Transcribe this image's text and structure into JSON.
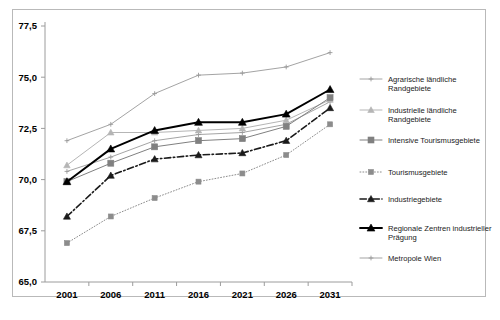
{
  "chart_data": {
    "type": "line",
    "title": "",
    "subtitle": "",
    "xlabel": "",
    "ylabel": "",
    "x": [
      2001,
      2006,
      2011,
      2016,
      2021,
      2026,
      2031
    ],
    "categories": [
      "2001",
      "2006",
      "2011",
      "2016",
      "2021",
      "2026",
      "2031"
    ],
    "ylim": [
      65.0,
      77.5
    ],
    "yticks": [
      65.0,
      67.5,
      70.0,
      72.5,
      75.0,
      77.5
    ],
    "ytick_labels": [
      "65,0",
      "67,5",
      "70,0",
      "72,5",
      "75,0",
      "77,5"
    ],
    "xtick_labels": [
      "2001",
      "2006",
      "2011",
      "2016",
      "2021",
      "2026",
      "2031"
    ],
    "grid": false,
    "legend_position": "right",
    "decimal_separator": ",",
    "series": [
      {
        "name": "Agrarische ländliche Randgebiete",
        "marker": "plus",
        "line_style": "solid",
        "color": "#9a9a9a",
        "values": [
          70.4,
          71.1,
          71.9,
          72.2,
          72.3,
          72.7,
          73.8
        ]
      },
      {
        "name": "Industrielle ländliche Randgebiete",
        "marker": "triangle",
        "line_style": "solid",
        "color": "#b5b5b5",
        "values": [
          70.7,
          72.3,
          72.3,
          72.4,
          72.5,
          72.9,
          73.9
        ]
      },
      {
        "name": "Intensive Tourismusgebiete",
        "marker": "square",
        "line_style": "solid",
        "color": "#808080",
        "values": [
          69.9,
          70.8,
          71.6,
          71.9,
          72.0,
          72.6,
          74.0
        ]
      },
      {
        "name": "Tourismusgebiete",
        "marker": "square",
        "line_style": "dotted",
        "color": "#8c8c8c",
        "values": [
          66.9,
          68.2,
          69.1,
          69.9,
          70.3,
          71.2,
          72.7
        ]
      },
      {
        "name": "Industriegebiete",
        "marker": "triangle",
        "line_style": "dashdot",
        "color": "#1a1a1a",
        "values": [
          68.2,
          70.2,
          71.0,
          71.2,
          71.3,
          71.9,
          73.5
        ]
      },
      {
        "name": "Regionale Zentren industrieller Prägung",
        "marker": "triangle",
        "line_style": "solid",
        "color": "#000000",
        "values": [
          69.9,
          71.5,
          72.4,
          72.8,
          72.8,
          73.2,
          74.4
        ]
      },
      {
        "name": "Metropole Wien",
        "marker": "plus",
        "line_style": "solid",
        "color": "#999999",
        "values": [
          71.9,
          72.7,
          74.2,
          75.1,
          75.2,
          75.5,
          76.2
        ]
      }
    ]
  },
  "legend": {
    "entries": [
      {
        "label_line1": "Agrarische ländliche",
        "label_line2": "Randgebiete"
      },
      {
        "label_line1": "Industrielle ländliche",
        "label_line2": "Randgebiete"
      },
      {
        "label_line1": "Intensive Tourismusgebiete",
        "label_line2": ""
      },
      {
        "label_line1": "Tourismusgebiete",
        "label_line2": ""
      },
      {
        "label_line1": "Industriegebiete",
        "label_line2": ""
      },
      {
        "label_line1": "Regionale Zentren industrieller",
        "label_line2": "Prägung"
      },
      {
        "label_line1": "Metropole Wien",
        "label_line2": ""
      }
    ]
  }
}
